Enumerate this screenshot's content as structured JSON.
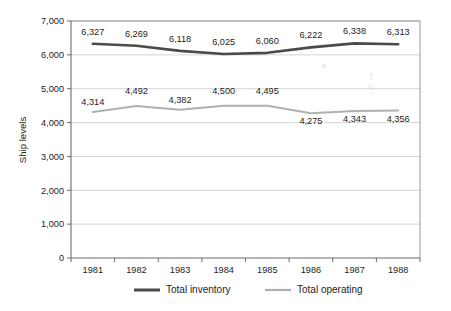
{
  "chart_data": {
    "type": "line",
    "title": "",
    "subtitle": "",
    "xlabel": "",
    "ylabel": "Ship levels",
    "categories": [
      "1981",
      "1982",
      "1983",
      "1984",
      "1985",
      "1986",
      "1987",
      "1988"
    ],
    "ylim": [
      0,
      7000
    ],
    "y_ticks": [
      0,
      1000,
      2000,
      3000,
      4000,
      5000,
      6000,
      7000
    ],
    "y_tick_labels": [
      "0",
      "1,000",
      "2,000",
      "3,000",
      "4,000",
      "5,000",
      "6,000",
      "7,000"
    ],
    "grid": "horizontal",
    "legend_position": "bottom",
    "series": [
      {
        "name": "Total inventory",
        "color": "#4a4a4a",
        "values": [
          6327,
          6269,
          6118,
          6025,
          6060,
          6222,
          6338,
          6313
        ],
        "labels": [
          "6,327",
          "6,269",
          "6,118",
          "6,025",
          "6,060",
          "6,222",
          "6,338",
          "6,313"
        ]
      },
      {
        "name": "Total operating",
        "color": "#b0b0b0",
        "values": [
          4314,
          4492,
          4382,
          4500,
          4495,
          4275,
          4343,
          4356
        ],
        "labels": [
          "4,314",
          "4,492",
          "4,382",
          "4,500",
          "4,495",
          "4,275",
          "4,343",
          "4,356"
        ]
      }
    ]
  },
  "axis": {
    "y_title": "Ship levels"
  },
  "legend": {
    "items": [
      {
        "label": "Total inventory",
        "color": "#4a4a4a"
      },
      {
        "label": "Total operating",
        "color": "#b0b0b0"
      }
    ]
  }
}
